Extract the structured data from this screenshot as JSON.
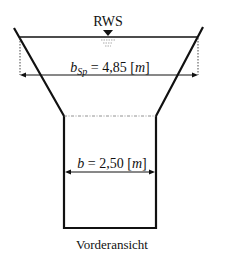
{
  "diagram": {
    "water_level_label": "RWS",
    "top_width": {
      "symbol": "b",
      "subscript": "Sp",
      "equals": " = 4,85 [",
      "unit": "m",
      "close": "]"
    },
    "bottom_width": {
      "symbol": "b",
      "equals": " = 2,50 [",
      "unit": "m",
      "close": "]"
    },
    "caption": "Vorderansicht",
    "colors": {
      "stroke": "#111111",
      "background": "#ffffff"
    }
  }
}
